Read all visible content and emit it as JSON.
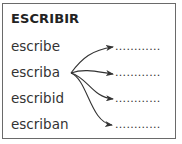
{
  "title": "ESCRIBIR",
  "forms": [
    {
      "word": "escribe",
      "blank": "............"
    },
    {
      "word": "escriba",
      "blank": "............"
    },
    {
      "word": "escribid",
      "blank": "............"
    },
    {
      "word": "escriban",
      "blank": "............"
    }
  ],
  "arrows": {
    "origin_word": "escriba",
    "targets": 4,
    "color": "#333333"
  }
}
